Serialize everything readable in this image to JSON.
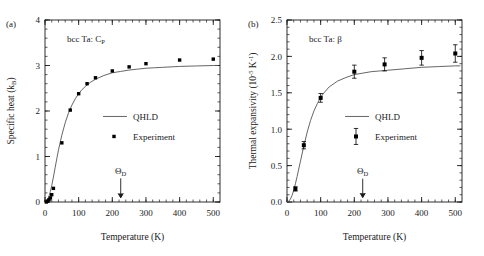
{
  "figure": {
    "background": "#ffffff",
    "foreground": "#1a1a1a",
    "curve_color": "#555555",
    "marker_color": "#000000"
  },
  "panels": [
    {
      "id": "a",
      "label": "(a)",
      "annotation_main": "bcc Ta: C",
      "annotation_sub": "P",
      "chart_data": {
        "type": "line",
        "title": "bcc Ta: C_P",
        "xlabel": "Temperature (K)",
        "ylabel_main": "Specific heat (k",
        "ylabel_sub": "B",
        "ylabel_tail": ")",
        "ylabel": "Specific heat (k_B)",
        "xlim": [
          0,
          520
        ],
        "ylim": [
          0,
          4
        ],
        "xticks": [
          0,
          100,
          200,
          300,
          400,
          500
        ],
        "xtick_labels": [
          "0",
          "100",
          "200",
          "300",
          "400",
          "500"
        ],
        "xminor_step": 20,
        "yticks": [
          0,
          1,
          2,
          3,
          4
        ],
        "ytick_labels": [
          "0",
          "1",
          "2",
          "3",
          "4"
        ],
        "yminor_step": 0.2,
        "grid": false,
        "legend_position": "center",
        "series": [
          {
            "name": "QHLD",
            "type": "line",
            "x": [
              0,
              4,
              8,
              12,
              16,
              20,
              25,
              30,
              35,
              40,
              50,
              60,
              70,
              80,
              90,
              100,
              110,
              120,
              135,
              150,
              175,
              200,
              225,
              250,
              275,
              300,
              325,
              350,
              400,
              450,
              500,
              515
            ],
            "y": [
              0.0,
              0.02,
              0.06,
              0.13,
              0.23,
              0.36,
              0.55,
              0.75,
              0.95,
              1.14,
              1.47,
              1.74,
              1.96,
              2.13,
              2.27,
              2.38,
              2.47,
              2.54,
              2.63,
              2.7,
              2.78,
              2.84,
              2.87,
              2.9,
              2.92,
              2.94,
              2.95,
              2.96,
              2.98,
              2.99,
              3.0,
              3.0
            ]
          },
          {
            "name": "Experiment",
            "type": "scatter",
            "marker": "square",
            "x": [
              4,
              8,
              12,
              16,
              20,
              25,
              50,
              75,
              100,
              125,
              150,
              200,
              250,
              300,
              400,
              500
            ],
            "y": [
              0.0,
              0.02,
              0.05,
              0.09,
              0.16,
              0.3,
              1.3,
              2.02,
              2.38,
              2.6,
              2.73,
              2.88,
              2.97,
              3.04,
              3.12,
              3.14
            ]
          }
        ],
        "annotations": [
          {
            "name": "debye-temperature",
            "text_main": "Θ",
            "text_sub": "D",
            "x": 225,
            "y_text": 0.62,
            "y_arrow_top": 0.52,
            "y_arrow_bottom": 0.09
          }
        ]
      },
      "legend": [
        {
          "label": "QHLD",
          "marker": "line"
        },
        {
          "label": "Experiment",
          "marker": "square"
        }
      ]
    },
    {
      "id": "b",
      "label": "(b)",
      "annotation_main": "bcc Ta: β",
      "annotation_sub": "",
      "chart_data": {
        "type": "line",
        "title": "bcc Ta: β",
        "xlabel": "Temperature (K)",
        "ylabel_main": "Thermal expansivity (10",
        "ylabel_sup": "-5",
        "ylabel_mid": " K",
        "ylabel_sup2": "-1",
        "ylabel_tail": ")",
        "ylabel": "Thermal expansivity (10^-5 K^-1)",
        "xlim": [
          0,
          520
        ],
        "ylim": [
          0,
          2.5
        ],
        "xticks": [
          0,
          100,
          200,
          300,
          400,
          500
        ],
        "xtick_labels": [
          "0",
          "100",
          "200",
          "300",
          "400",
          "500"
        ],
        "xminor_step": 20,
        "yticks": [
          0.0,
          0.5,
          1.0,
          1.5,
          2.0,
          2.5
        ],
        "ytick_labels": [
          "0.0",
          "0.5",
          "1.0",
          "1.5",
          "2.0",
          "2.5"
        ],
        "yminor_step": 0.1,
        "grid": false,
        "legend_position": "center",
        "series": [
          {
            "name": "QHLD",
            "type": "line",
            "x": [
              0,
              5,
              10,
              15,
              20,
              25,
              30,
              40,
              50,
              60,
              70,
              80,
              90,
              100,
              110,
              125,
              150,
              175,
              200,
              225,
              250,
              275,
              300,
              350,
              400,
              450,
              500,
              515
            ],
            "y": [
              0.0,
              0.01,
              0.04,
              0.09,
              0.16,
              0.25,
              0.35,
              0.56,
              0.77,
              0.96,
              1.12,
              1.25,
              1.35,
              1.44,
              1.5,
              1.58,
              1.66,
              1.71,
              1.75,
              1.77,
              1.79,
              1.8,
              1.81,
              1.83,
              1.85,
              1.86,
              1.87,
              1.87
            ]
          },
          {
            "name": "Experiment",
            "type": "scatter",
            "marker": "square",
            "errorbars": true,
            "x": [
              25,
              50,
              100,
              200,
              290,
              400,
              500
            ],
            "y": [
              0.18,
              0.78,
              1.43,
              1.79,
              1.89,
              1.98,
              2.04
            ],
            "yerr": [
              0.03,
              0.05,
              0.06,
              0.09,
              0.09,
              0.1,
              0.12
            ]
          }
        ],
        "annotations": [
          {
            "name": "debye-temperature",
            "text_main": "Θ",
            "text_sub": "D",
            "x": 225,
            "y_text": 0.38,
            "y_arrow_top": 0.32,
            "y_arrow_bottom": 0.06
          }
        ]
      },
      "legend": [
        {
          "label": "QHLD",
          "marker": "line"
        },
        {
          "label": "Experiment",
          "marker": "square-errorbar"
        }
      ]
    }
  ]
}
